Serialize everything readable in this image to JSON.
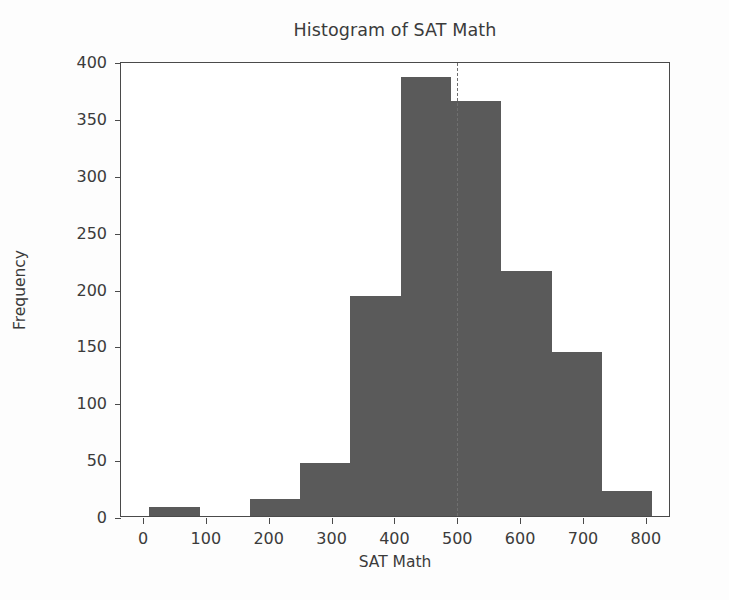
{
  "chart_data": {
    "type": "bar",
    "subtype": "histogram",
    "title": "Histogram of SAT Math",
    "xlabel": "SAT Math",
    "ylabel": "Frequency",
    "xlim": [
      -35,
      840
    ],
    "ylim": [
      0,
      400
    ],
    "grid": false,
    "legend": null,
    "bar_color": "#5a5a5a",
    "axis_color": "#4a4a4a",
    "bin_edges": [
      10,
      90,
      170,
      250,
      330,
      410,
      490,
      570,
      650,
      730,
      810
    ],
    "categories": [
      "10-90",
      "90-170",
      "170-250",
      "250-330",
      "330-410",
      "410-490",
      "490-570",
      "570-650",
      "650-730",
      "730-810"
    ],
    "values": [
      8,
      0,
      15,
      47,
      193,
      386,
      365,
      215,
      144,
      22
    ],
    "xticks": [
      0,
      100,
      200,
      300,
      400,
      500,
      600,
      700,
      800
    ],
    "xticklabels": [
      "0",
      "100",
      "200",
      "300",
      "400",
      "500",
      "600",
      "700",
      "800"
    ],
    "yticks": [
      0,
      50,
      100,
      150,
      200,
      250,
      300,
      350,
      400
    ],
    "yticklabels": [
      "0",
      "50",
      "100",
      "150",
      "200",
      "250",
      "300",
      "350",
      "400"
    ],
    "annotations": [
      {
        "name": "mean-line",
        "type": "vline",
        "x": 500,
        "style": "dashed",
        "color": "#6f6f6f"
      }
    ]
  }
}
